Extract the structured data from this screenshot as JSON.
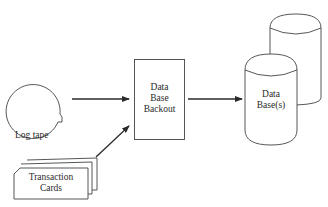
{
  "diagram": {
    "nodes": {
      "log_tape": {
        "label": "Log tape",
        "shape": "tape-reel"
      },
      "transaction_cards": {
        "label_line1": "Transaction",
        "label_line2": "Cards",
        "shape": "card-deck"
      },
      "backout": {
        "label_line1": "Data",
        "label_line2": "Base",
        "label_line3": "Backout",
        "shape": "rectangle"
      },
      "databases": {
        "label_line1": "Data",
        "label_line2": "Base(s)",
        "shape": "stacked-cylinders"
      }
    },
    "edges": [
      {
        "from": "log_tape",
        "to": "backout"
      },
      {
        "from": "transaction_cards",
        "to": "backout"
      },
      {
        "from": "backout",
        "to": "databases"
      }
    ],
    "colors": {
      "stroke": "#3a3a3a",
      "background": "#ffffff"
    }
  }
}
